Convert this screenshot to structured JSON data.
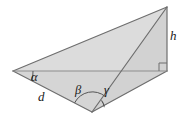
{
  "figure": {
    "type": "geometry-diagram",
    "canvas": {
      "width": 183,
      "height": 121,
      "background": "#ffffff"
    },
    "style": {
      "fill_color": "#d9d9d9",
      "fill_color_light": "#e2e2e2",
      "stroke_color": "#6e6e6e",
      "stroke_width": 1.1,
      "arc_color": "#555555",
      "label_color": "#1a1a1a"
    },
    "vertices": [
      {
        "name": "left-vertex",
        "id": "A",
        "x": 13,
        "y": 71
      },
      {
        "name": "apex-vertex",
        "id": "C",
        "x": 167,
        "y": 7
      },
      {
        "name": "bottom-vertex",
        "id": "B",
        "x": 92,
        "y": 112
      },
      {
        "name": "right-angle-corner",
        "id": "D",
        "x": 167,
        "y": 71
      }
    ],
    "labels": [
      {
        "name": "angle-alpha",
        "text": "α",
        "x": 31,
        "y": 71,
        "kind": "greek"
      },
      {
        "name": "angle-beta",
        "text": "β",
        "x": 75,
        "y": 84,
        "kind": "greek"
      },
      {
        "name": "angle-gamma",
        "text": "γ",
        "x": 104,
        "y": 84,
        "kind": "greek"
      },
      {
        "name": "side-d",
        "text": "d",
        "x": 38,
        "y": 90,
        "kind": "latin"
      },
      {
        "name": "height-h",
        "text": "h",
        "x": 170,
        "y": 29,
        "kind": "latin"
      }
    ],
    "angle_arcs": [
      {
        "name": "alpha-arc",
        "vertex": "A",
        "radius": 19
      },
      {
        "name": "beta-arc",
        "vertex": "B",
        "radius": 20
      },
      {
        "name": "gamma-arc",
        "vertex": "B",
        "radius": 15
      }
    ],
    "right_angle": {
      "name": "right-angle-marker",
      "vertex": "D",
      "size": 8
    }
  }
}
